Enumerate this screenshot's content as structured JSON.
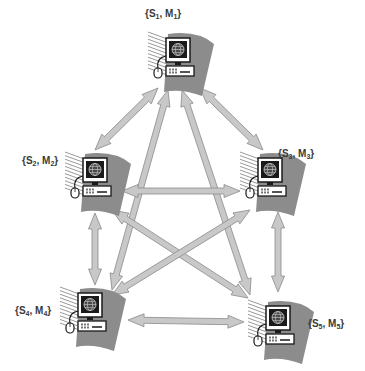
{
  "diagram": {
    "type": "fully-connected-network",
    "colors": {
      "arrow_fill": "#c8c8c8",
      "arrow_stroke": "#8a8a8a",
      "wedge": "#8c8c8c",
      "monitor": "#1a1a1a",
      "screen": "#4a4a4a"
    },
    "nodes": [
      {
        "id": "n1",
        "label_s": "S",
        "label_s_sub": "1",
        "label_m": "M",
        "label_m_sub": "1",
        "x": 178,
        "y": 60,
        "label_x": 145,
        "label_y": 8
      },
      {
        "id": "n2",
        "label_s": "S",
        "label_s_sub": "2",
        "label_m": "M",
        "label_m_sub": "2",
        "x": 95,
        "y": 180,
        "label_x": 22,
        "label_y": 155
      },
      {
        "id": "n3",
        "label_s": "S",
        "label_s_sub": "3",
        "label_m": "M",
        "label_m_sub": "3",
        "x": 270,
        "y": 180,
        "label_x": 278,
        "label_y": 148
      },
      {
        "id": "n4",
        "label_s": "S",
        "label_s_sub": "4",
        "label_m": "M",
        "label_m_sub": "4",
        "x": 90,
        "y": 315,
        "label_x": 15,
        "label_y": 305
      },
      {
        "id": "n5",
        "label_s": "S",
        "label_s_sub": "5",
        "label_m": "M",
        "label_m_sub": "5",
        "x": 278,
        "y": 328,
        "label_x": 308,
        "label_y": 318
      }
    ],
    "edges": [
      {
        "from": "n1",
        "to": "n2",
        "x1": 158,
        "y1": 88,
        "x2": 95,
        "y2": 150
      },
      {
        "from": "n1",
        "to": "n3",
        "x1": 200,
        "y1": 88,
        "x2": 263,
        "y2": 150
      },
      {
        "from": "n1",
        "to": "n4",
        "x1": 168,
        "y1": 90,
        "x2": 112,
        "y2": 290
      },
      {
        "from": "n1",
        "to": "n5",
        "x1": 182,
        "y1": 90,
        "x2": 250,
        "y2": 295
      },
      {
        "from": "n2",
        "to": "n3",
        "x1": 122,
        "y1": 191,
        "x2": 240,
        "y2": 191
      },
      {
        "from": "n2",
        "to": "n4",
        "x1": 95,
        "y1": 213,
        "x2": 95,
        "y2": 285
      },
      {
        "from": "n2",
        "to": "n5",
        "x1": 112,
        "y1": 210,
        "x2": 248,
        "y2": 298
      },
      {
        "from": "n3",
        "to": "n4",
        "x1": 250,
        "y1": 210,
        "x2": 112,
        "y2": 295
      },
      {
        "from": "n3",
        "to": "n5",
        "x1": 278,
        "y1": 212,
        "x2": 278,
        "y2": 292
      },
      {
        "from": "n4",
        "to": "n5",
        "x1": 128,
        "y1": 320,
        "x2": 244,
        "y2": 322
      }
    ]
  }
}
